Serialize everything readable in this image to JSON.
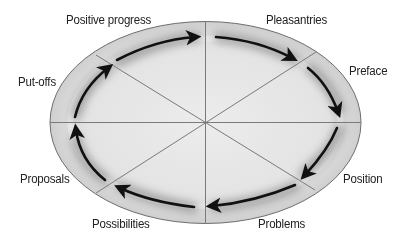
{
  "diagram": {
    "type": "cycle",
    "stages": [
      {
        "id": "pleasantries",
        "label": "Pleasantries"
      },
      {
        "id": "preface",
        "label": "Preface"
      },
      {
        "id": "position",
        "label": "Position"
      },
      {
        "id": "problems",
        "label": "Problems"
      },
      {
        "id": "possibilities",
        "label": "Possibilities"
      },
      {
        "id": "proposals",
        "label": "Proposals"
      },
      {
        "id": "put-offs",
        "label": "Put-offs"
      },
      {
        "id": "positive-progress",
        "label": "Positive progress"
      }
    ],
    "direction": "clockwise",
    "colors": {
      "fill": "#e6e6e6",
      "outline": "#6e6e6e",
      "spokes": "#7a7a7a",
      "arrows": "#111111",
      "shadow": "#8a8a8a",
      "text": "#222222"
    }
  }
}
